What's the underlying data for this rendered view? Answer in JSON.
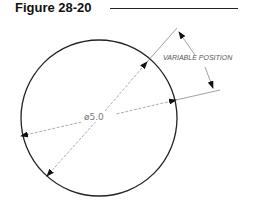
{
  "figure": {
    "title": "Figure 28-20",
    "circle_diameter_label": "ø5.0",
    "variable_label": "VARIABLE  POSITION"
  },
  "colors": {
    "outline": "#222222",
    "dimension_line": "#888888",
    "text": "#555555"
  }
}
